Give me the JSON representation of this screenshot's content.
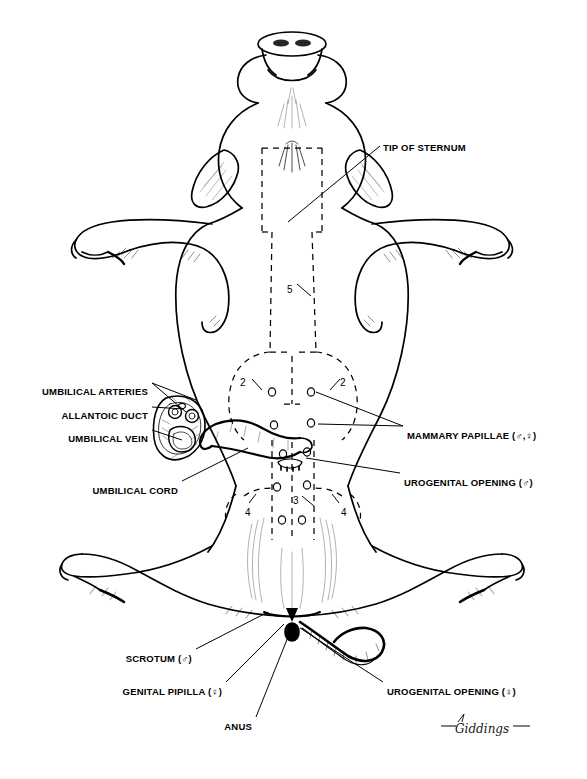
{
  "figure": {
    "view": "ventral",
    "background_color": "#ffffff",
    "ink_color": "#000000"
  },
  "labels": [
    {
      "id": "tip-of-sternum",
      "text": "TIP OF STERNUM",
      "align": "left",
      "x": 383,
      "y": 142
    },
    {
      "id": "umbilical-arteries",
      "text": "UMBILICAL ARTERIES",
      "align": "right",
      "x": 148,
      "y": 386
    },
    {
      "id": "allantoic-duct",
      "text": "ALLANTOIC DUCT",
      "align": "right",
      "x": 148,
      "y": 410
    },
    {
      "id": "umbilical-vein",
      "text": "UMBILICAL VEIN",
      "align": "right",
      "x": 148,
      "y": 433
    },
    {
      "id": "umbilical-cord",
      "text": "UMBILICAL CORD",
      "align": "right",
      "x": 178,
      "y": 485
    },
    {
      "id": "mammary-papillae",
      "text": "MAMMARY PAPILLAE  (♂,♀)",
      "align": "left",
      "x": 407,
      "y": 430
    },
    {
      "id": "urogenital-opening-m",
      "text": "UROGENITAL OPENING (♂)",
      "align": "left",
      "x": 404,
      "y": 477
    },
    {
      "id": "scrotum-m",
      "text": "SCROTUM (♂)",
      "align": "right",
      "x": 192,
      "y": 653
    },
    {
      "id": "genital-papilla-f",
      "text": "GENITAL PIPILLA (♀)",
      "align": "right",
      "x": 222,
      "y": 686
    },
    {
      "id": "anus",
      "text": "ANUS",
      "align": "right",
      "x": 252,
      "y": 721
    },
    {
      "id": "urogenital-opening-f",
      "text": "UROGENITAL OPENING  (♀)",
      "align": "left",
      "x": 387,
      "y": 686
    }
  ],
  "callout_numbers": [
    {
      "id": "callout-5",
      "text": "5",
      "x": 287,
      "y": 284
    },
    {
      "id": "callout-2-left",
      "text": "2",
      "x": 240,
      "y": 377
    },
    {
      "id": "callout-2-right",
      "text": "2",
      "x": 340,
      "y": 377
    },
    {
      "id": "callout-3",
      "text": "3",
      "x": 293,
      "y": 495
    },
    {
      "id": "callout-4-left",
      "text": "4",
      "x": 245,
      "y": 507
    },
    {
      "id": "callout-4-right",
      "text": "4",
      "x": 341,
      "y": 507
    }
  ],
  "signature": {
    "text": "Giddings",
    "x": 455,
    "y": 722
  },
  "legend_notes": {
    "male_symbol": "♂",
    "female_symbol": "♀",
    "incision_style": "dashed",
    "numbers_meaning": "numbered incision-line segments 2–5"
  }
}
